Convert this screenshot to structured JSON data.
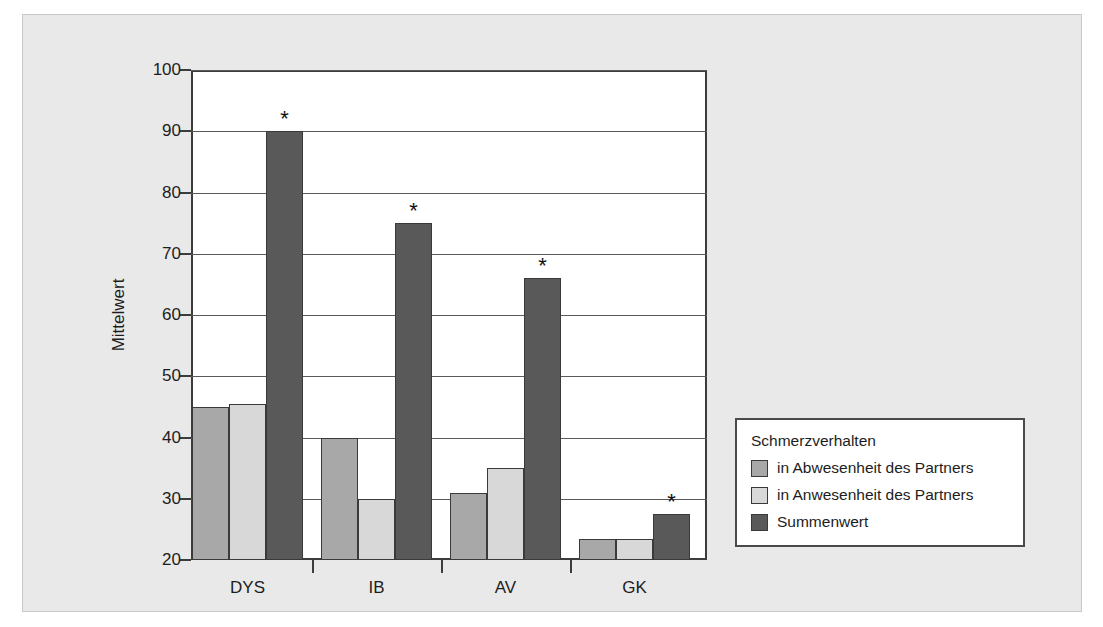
{
  "chart_data": {
    "type": "bar",
    "title": "",
    "xlabel": "",
    "ylabel": "Mittelwert",
    "categories": [
      "DYS",
      "IB",
      "AV",
      "GK"
    ],
    "ylim": [
      20,
      100
    ],
    "yticks": [
      20,
      30,
      40,
      50,
      60,
      70,
      80,
      90,
      100
    ],
    "grid": true,
    "legend_position": "right-bottom-outside",
    "legend_title": "Schmerzverhalten",
    "series": [
      {
        "name": "in Abwesenheit des Partners",
        "color": "#a8a8a8",
        "values": [
          45,
          40,
          31,
          23.5
        ]
      },
      {
        "name": "in Anwesenheit des Partners",
        "color": "#d8d8d8",
        "values": [
          45.5,
          30,
          35,
          23.5
        ]
      },
      {
        "name": "Summenwert",
        "color": "#595959",
        "values": [
          90,
          75,
          66,
          27.5
        ]
      }
    ],
    "annotations": [
      {
        "text": "*",
        "category": "DYS",
        "series": "Summenwert"
      },
      {
        "text": "*",
        "category": "IB",
        "series": "Summenwert"
      },
      {
        "text": "*",
        "category": "AV",
        "series": "Summenwert"
      },
      {
        "text": "*",
        "category": "GK",
        "series": "Summenwert"
      }
    ]
  },
  "figure": {
    "background": "#e9e9e9",
    "plot_background": "#ffffff",
    "axis_color": "#3c3c3c"
  }
}
